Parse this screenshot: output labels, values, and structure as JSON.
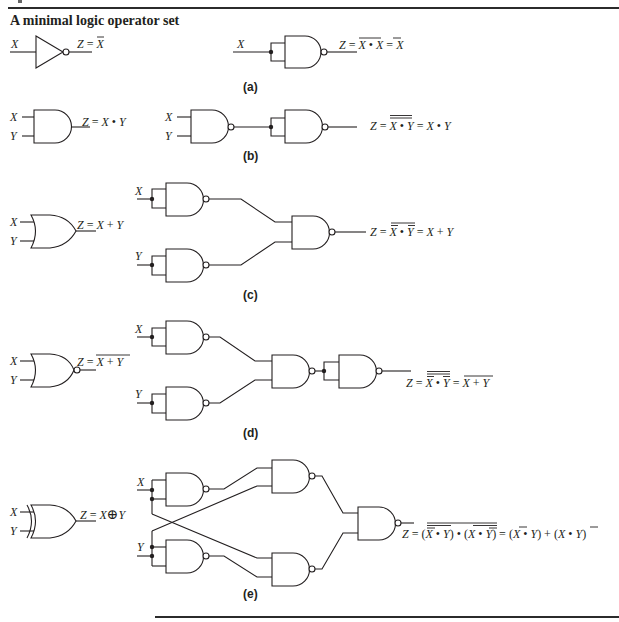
{
  "figure": {
    "title": "A minimal logic operator set",
    "panels": [
      {
        "label": "(a)",
        "left_gate": "NOT",
        "left_inputs": [
          "X"
        ],
        "left_expression": "Z = X̄",
        "nand_equivalent": "Z = (X • X)̄ = X̄"
      },
      {
        "label": "(b)",
        "left_gate": "AND",
        "left_inputs": [
          "X",
          "Y"
        ],
        "left_expression": "Z = X • Y",
        "nand_equivalent": "Z = ((X • Y)̄)̄ = X • Y"
      },
      {
        "label": "(c)",
        "left_gate": "OR",
        "left_inputs": [
          "X",
          "Y"
        ],
        "left_expression": "Z = X + Y",
        "nand_equivalent": "Z = (X̄ • Ȳ)̄ = X + Y"
      },
      {
        "label": "(d)",
        "left_gate": "NOR",
        "left_inputs": [
          "X",
          "Y"
        ],
        "left_expression": "Z = (X + Y)̄",
        "nand_equivalent": "Z = ((X̄ • Ȳ)̄)̄ = (X + Y)̄"
      },
      {
        "label": "(e)",
        "left_gate": "XOR",
        "left_inputs": [
          "X",
          "Y"
        ],
        "left_expression": "Z = X ⊕ Y",
        "nand_equivalent": "Z = ((X̄ • Y)̄ • (X • Ȳ)̄)̄ = (X̄ • Y) + (X • Ȳ)"
      }
    ]
  },
  "labels": {
    "title": "A minimal logic operator set",
    "a": "(a)",
    "b": "(b)",
    "c": "(c)",
    "d": "(d)",
    "e": "(e)",
    "X": "X",
    "Y": "Y",
    "Z": "Z",
    "eq": "=",
    "dot": "•",
    "plus": "+",
    "xor": "⊕",
    "lparen": "(",
    "rparen": ")"
  }
}
